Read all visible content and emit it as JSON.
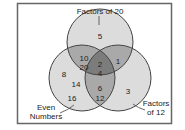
{
  "diagram": {
    "type": "venn",
    "sets": {
      "top": {
        "label": "Factors of 20"
      },
      "left": {
        "label_line1": "Even",
        "label_line2": "Numbers"
      },
      "right": {
        "label_line1": "Factors",
        "label_line2": "of 12"
      }
    },
    "regions": {
      "top_only": [
        "5"
      ],
      "left_only": [
        "8",
        "14",
        "16"
      ],
      "right_only": [
        "3"
      ],
      "top_left": [
        "10",
        "20"
      ],
      "top_right": [
        "1"
      ],
      "left_right": [
        "6",
        "12"
      ],
      "all_three": [
        "2",
        "4"
      ]
    },
    "colors": {
      "circle_fill": "#d9d9d9",
      "double_overlap": "#a8a8a8",
      "triple_overlap": "#7a7a7a",
      "stroke": "#444444",
      "frame": "#666666"
    }
  }
}
